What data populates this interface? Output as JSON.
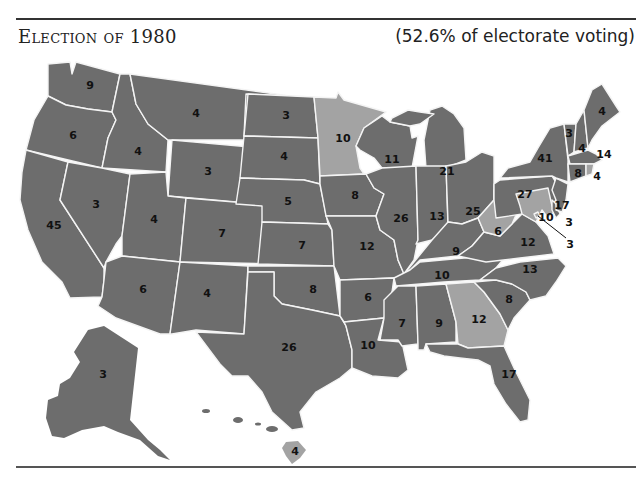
{
  "header": {
    "title": "Election of 1980",
    "subtitle": "(52.6% of electorate voting)"
  },
  "colors": {
    "reagan": "#6d6d6d",
    "carter": "#a3a3a3",
    "border": "#f4f4f4",
    "label": "#111111"
  },
  "states": [
    {
      "name": "Washington",
      "abbr": "WA",
      "votes": "9",
      "winner": "reagan"
    },
    {
      "name": "Oregon",
      "abbr": "OR",
      "votes": "6",
      "winner": "reagan"
    },
    {
      "name": "California",
      "abbr": "CA",
      "votes": "45",
      "winner": "reagan"
    },
    {
      "name": "Idaho",
      "abbr": "ID",
      "votes": "4",
      "winner": "reagan"
    },
    {
      "name": "Nevada",
      "abbr": "NV",
      "votes": "3",
      "winner": "reagan"
    },
    {
      "name": "Montana",
      "abbr": "MT",
      "votes": "4",
      "winner": "reagan"
    },
    {
      "name": "Wyoming",
      "abbr": "WY",
      "votes": "3",
      "winner": "reagan"
    },
    {
      "name": "Utah",
      "abbr": "UT",
      "votes": "4",
      "winner": "reagan"
    },
    {
      "name": "Arizona",
      "abbr": "AZ",
      "votes": "6",
      "winner": "reagan"
    },
    {
      "name": "Colorado",
      "abbr": "CO",
      "votes": "7",
      "winner": "reagan"
    },
    {
      "name": "New Mexico",
      "abbr": "NM",
      "votes": "4",
      "winner": "reagan"
    },
    {
      "name": "North Dakota",
      "abbr": "ND",
      "votes": "3",
      "winner": "reagan"
    },
    {
      "name": "South Dakota",
      "abbr": "SD",
      "votes": "4",
      "winner": "reagan"
    },
    {
      "name": "Nebraska",
      "abbr": "NE",
      "votes": "5",
      "winner": "reagan"
    },
    {
      "name": "Kansas",
      "abbr": "KS",
      "votes": "7",
      "winner": "reagan"
    },
    {
      "name": "Oklahoma",
      "abbr": "OK",
      "votes": "8",
      "winner": "reagan"
    },
    {
      "name": "Texas",
      "abbr": "TX",
      "votes": "26",
      "winner": "reagan"
    },
    {
      "name": "Minnesota",
      "abbr": "MN",
      "votes": "10",
      "winner": "carter"
    },
    {
      "name": "Iowa",
      "abbr": "IA",
      "votes": "8",
      "winner": "reagan"
    },
    {
      "name": "Missouri",
      "abbr": "MO",
      "votes": "12",
      "winner": "reagan"
    },
    {
      "name": "Arkansas",
      "abbr": "AR",
      "votes": "6",
      "winner": "reagan"
    },
    {
      "name": "Louisiana",
      "abbr": "LA",
      "votes": "10",
      "winner": "reagan"
    },
    {
      "name": "Wisconsin",
      "abbr": "WI",
      "votes": "11",
      "winner": "reagan"
    },
    {
      "name": "Illinois",
      "abbr": "IL",
      "votes": "26",
      "winner": "reagan"
    },
    {
      "name": "Michigan",
      "abbr": "MI",
      "votes": "21",
      "winner": "reagan"
    },
    {
      "name": "Indiana",
      "abbr": "IN",
      "votes": "13",
      "winner": "reagan"
    },
    {
      "name": "Ohio",
      "abbr": "OH",
      "votes": "25",
      "winner": "reagan"
    },
    {
      "name": "Kentucky",
      "abbr": "KY",
      "votes": "9",
      "winner": "reagan"
    },
    {
      "name": "Tennessee",
      "abbr": "TN",
      "votes": "10",
      "winner": "reagan"
    },
    {
      "name": "Mississippi",
      "abbr": "MS",
      "votes": "7",
      "winner": "reagan"
    },
    {
      "name": "Alabama",
      "abbr": "AL",
      "votes": "9",
      "winner": "reagan"
    },
    {
      "name": "Georgia",
      "abbr": "GA",
      "votes": "12",
      "winner": "carter"
    },
    {
      "name": "Florida",
      "abbr": "FL",
      "votes": "17",
      "winner": "reagan"
    },
    {
      "name": "South Carolina",
      "abbr": "SC",
      "votes": "8",
      "winner": "reagan"
    },
    {
      "name": "North Carolina",
      "abbr": "NC",
      "votes": "13",
      "winner": "reagan"
    },
    {
      "name": "Virginia",
      "abbr": "VA",
      "votes": "12",
      "winner": "reagan"
    },
    {
      "name": "West Virginia",
      "abbr": "WV",
      "votes": "6",
      "winner": "carter"
    },
    {
      "name": "Pennsylvania",
      "abbr": "PA",
      "votes": "27",
      "winner": "reagan"
    },
    {
      "name": "New York",
      "abbr": "NY",
      "votes": "41",
      "winner": "reagan"
    },
    {
      "name": "Vermont",
      "abbr": "VT",
      "votes": "3",
      "winner": "reagan"
    },
    {
      "name": "New Hampshire",
      "abbr": "NH",
      "votes": "4",
      "winner": "reagan"
    },
    {
      "name": "Maine",
      "abbr": "ME",
      "votes": "4",
      "winner": "reagan"
    },
    {
      "name": "Massachusetts",
      "abbr": "MA",
      "votes": "14",
      "winner": "reagan"
    },
    {
      "name": "Rhode Island",
      "abbr": "RI",
      "votes": "4",
      "winner": "carter"
    },
    {
      "name": "Connecticut",
      "abbr": "CT",
      "votes": "8",
      "winner": "reagan"
    },
    {
      "name": "New Jersey",
      "abbr": "NJ",
      "votes": "17",
      "winner": "reagan"
    },
    {
      "name": "Delaware",
      "abbr": "DE",
      "votes": "3",
      "winner": "reagan"
    },
    {
      "name": "Maryland",
      "abbr": "MD",
      "votes": "10",
      "winner": "carter"
    },
    {
      "name": "District of Columbia",
      "abbr": "DC",
      "votes": "3",
      "winner": "carter"
    },
    {
      "name": "Alaska",
      "abbr": "AK",
      "votes": "3",
      "winner": "reagan"
    },
    {
      "name": "Hawaii",
      "abbr": "HI",
      "votes": "4",
      "winner": "carter"
    }
  ]
}
